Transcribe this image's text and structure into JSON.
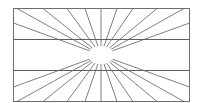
{
  "diagram": {
    "title": "",
    "type": "radiating-lines illusion",
    "line_color": "#707070",
    "background": "#ffffff",
    "parallel_lines": 2,
    "ray_count_top": 9,
    "ray_count_bottom": 9,
    "ray_count_side_each": 2,
    "center_gap": true
  }
}
